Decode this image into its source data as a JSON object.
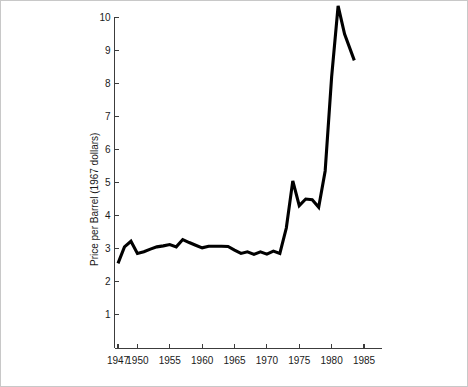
{
  "figure": {
    "background_color": "#ffffff",
    "border_color": "#c8c8c8",
    "line_color": "#000000",
    "axis_color": "#3c3c3c"
  },
  "axes": {
    "ylabel": "Price per Barrel (1967 dollars)",
    "xlabel": "",
    "y_tick_labels": [
      "1",
      "2",
      "3",
      "4",
      "5",
      "6",
      "7",
      "8",
      "9",
      "10"
    ],
    "x_tick_labels": [
      "1947",
      "1950",
      "1955",
      "1960",
      "1965",
      "1970",
      "1975",
      "1980",
      "1985"
    ]
  },
  "chart_data": {
    "type": "line",
    "title": "",
    "xlabel": "",
    "ylabel": "Price per Barrel (1967 dollars)",
    "xlim": [
      1946.0,
      1986.5
    ],
    "ylim": [
      0,
      10.6
    ],
    "grid": false,
    "legend": "none",
    "x_ticks": [
      1947,
      1950,
      1955,
      1960,
      1965,
      1970,
      1975,
      1980,
      1985
    ],
    "y_ticks": [
      1,
      2,
      3,
      4,
      5,
      6,
      7,
      8,
      9,
      10
    ],
    "x": [
      1947,
      1948,
      1949,
      1950,
      1951,
      1952,
      1953,
      1954,
      1955,
      1956,
      1957,
      1958,
      1959,
      1960,
      1961,
      1962,
      1963,
      1964,
      1965,
      1966,
      1967,
      1968,
      1969,
      1970,
      1971,
      1972,
      1973,
      1974,
      1975,
      1976,
      1977,
      1978,
      1979,
      1980,
      1981,
      1982,
      1983.5
    ],
    "y": [
      2.55,
      3.05,
      3.22,
      2.85,
      2.9,
      2.98,
      3.05,
      3.08,
      3.12,
      3.05,
      3.27,
      3.18,
      3.1,
      3.02,
      3.07,
      3.07,
      3.07,
      3.06,
      2.95,
      2.85,
      2.9,
      2.82,
      2.9,
      2.83,
      2.92,
      2.85,
      3.62,
      5.05,
      4.3,
      4.5,
      4.48,
      4.25,
      5.35,
      8.2,
      10.35,
      9.5,
      8.7
    ],
    "series": [
      {
        "name": "Price per Barrel (1967 dollars)",
        "color": "#000000",
        "values": [
          2.55,
          3.05,
          3.22,
          2.85,
          2.9,
          2.98,
          3.05,
          3.08,
          3.12,
          3.05,
          3.27,
          3.18,
          3.1,
          3.02,
          3.07,
          3.07,
          3.07,
          3.06,
          2.95,
          2.85,
          2.9,
          2.82,
          2.9,
          2.83,
          2.92,
          2.85,
          3.62,
          5.05,
          4.3,
          4.5,
          4.48,
          4.25,
          5.35,
          8.2,
          10.35,
          9.5,
          8.7
        ]
      }
    ]
  }
}
